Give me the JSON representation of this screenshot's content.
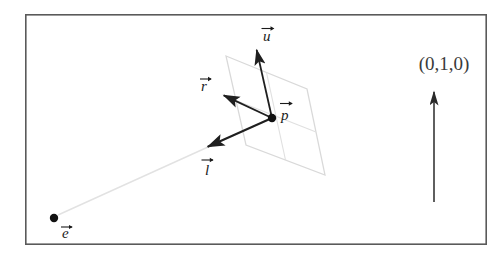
{
  "figure": {
    "kind": "vector-diagram",
    "caption_text": "",
    "background_color": "#ffffff",
    "border": {
      "name": "figure-frame",
      "x": 25,
      "y": 14,
      "width": 462,
      "height": 231,
      "stroke_color": "#5a5a5a",
      "stroke_width": 1.6
    },
    "colors": {
      "vector_stroke": "#1f1f1f",
      "plane_stroke": "#d9d9d9",
      "plane_fill": "#ffffff",
      "ray_stroke": "#e2e2e2",
      "point_fill": "#111111",
      "label_text": "#1a1a1a",
      "coord_text": "#3a3a3a"
    },
    "plane": {
      "name": "image-plane",
      "corners": [
        [
          226,
          56
        ],
        [
          307,
          89
        ],
        [
          325,
          175
        ],
        [
          246,
          145
        ]
      ],
      "grid_divisions": 2
    },
    "points": [
      {
        "id": "p",
        "name": "point-p",
        "label": "p",
        "has_vector_accent": true,
        "x": 272,
        "y": 118,
        "radius": 4.2,
        "label_x": 280,
        "label_y": 114
      },
      {
        "id": "e",
        "name": "point-e",
        "label": "e",
        "has_vector_accent": true,
        "x": 54,
        "y": 218,
        "radius": 4.2,
        "label_x": 62,
        "label_y": 236
      }
    ],
    "vectors": [
      {
        "id": "u",
        "name": "vector-u",
        "label": "u",
        "from": [
          272,
          118
        ],
        "to": [
          256,
          47
        ],
        "label_x": 263,
        "label_y": 40
      },
      {
        "id": "r",
        "name": "vector-r",
        "label": "r",
        "from": [
          272,
          118
        ],
        "to": [
          221,
          94
        ],
        "label_x": 201,
        "label_y": 90
      },
      {
        "id": "l",
        "name": "vector-l",
        "label": "l",
        "from": [
          272,
          118
        ],
        "to": [
          205,
          148
        ],
        "label_x": 203,
        "label_y": 174
      }
    ],
    "ray": {
      "name": "eye-ray",
      "from": [
        58,
        215
      ],
      "to": [
        272,
        118
      ]
    },
    "annotation": {
      "name": "world-up-annotation",
      "text": "(0,1,0)",
      "text_x": 444,
      "text_y": 70,
      "arrow_from": [
        434,
        202
      ],
      "arrow_to": [
        434,
        88
      ]
    }
  }
}
